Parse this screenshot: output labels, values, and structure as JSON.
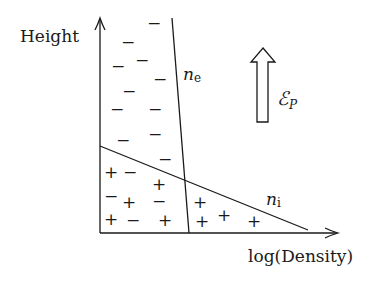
{
  "diagram": {
    "type": "plasma density profile",
    "axes": {
      "y_label": "Height",
      "x_label": "log(Density)"
    },
    "curves": {
      "electron": {
        "label_main": "n",
        "label_sub": "e"
      },
      "ion": {
        "label_main": "n",
        "label_sub": "i"
      }
    },
    "field_arrow": {
      "label_main": "ℰ",
      "label_sub": "P",
      "direction": "up"
    },
    "charges": {
      "minus_glyph": "−",
      "plus_glyph": "+",
      "electron_region": [
        {
          "sign": "−",
          "x": 154,
          "y": 23
        },
        {
          "sign": "−",
          "x": 128,
          "y": 42
        },
        {
          "sign": "−",
          "x": 142,
          "y": 60
        },
        {
          "sign": "−",
          "x": 118,
          "y": 66
        },
        {
          "sign": "−",
          "x": 160,
          "y": 79
        },
        {
          "sign": "−",
          "x": 129,
          "y": 91
        },
        {
          "sign": "−",
          "x": 117,
          "y": 109
        },
        {
          "sign": "−",
          "x": 155,
          "y": 109
        },
        {
          "sign": "−",
          "x": 155,
          "y": 134
        },
        {
          "sign": "−",
          "x": 123,
          "y": 140
        }
      ],
      "mixed_region": [
        {
          "sign": "−",
          "x": 165,
          "y": 159
        },
        {
          "sign": "+",
          "x": 111,
          "y": 172
        },
        {
          "sign": "−",
          "x": 130,
          "y": 172
        },
        {
          "sign": "+",
          "x": 159,
          "y": 184
        },
        {
          "sign": "−",
          "x": 111,
          "y": 196
        },
        {
          "sign": "+",
          "x": 129,
          "y": 202
        },
        {
          "sign": "−",
          "x": 159,
          "y": 201
        },
        {
          "sign": "+",
          "x": 111,
          "y": 219
        },
        {
          "sign": "−",
          "x": 133,
          "y": 220
        },
        {
          "sign": "+",
          "x": 165,
          "y": 220
        }
      ],
      "ion_region": [
        {
          "sign": "+",
          "x": 200,
          "y": 202
        },
        {
          "sign": "+",
          "x": 202,
          "y": 221
        },
        {
          "sign": "+",
          "x": 224,
          "y": 215
        },
        {
          "sign": "+",
          "x": 254,
          "y": 221
        }
      ]
    }
  }
}
